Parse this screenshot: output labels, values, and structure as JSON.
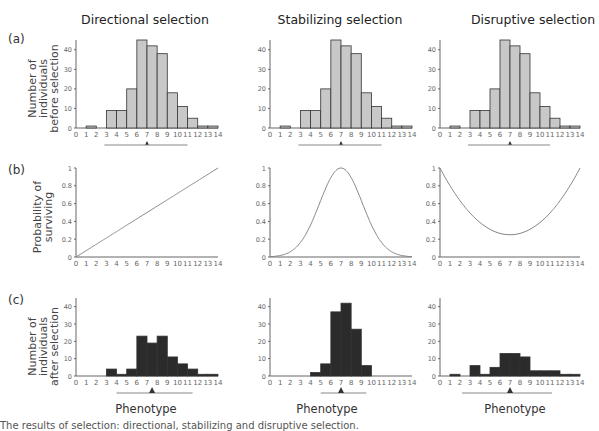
{
  "columns": [
    {
      "title": "Directional selection",
      "xlabel": "Phenotype"
    },
    {
      "title": "Stabilizing selection",
      "xlabel": "Phenotype"
    },
    {
      "title": "Disruptive selection",
      "xlabel": "Phenotype"
    }
  ],
  "rows": [
    {
      "label": "(a)",
      "ylabel_lines": [
        "Number of",
        "individuals",
        "before selection"
      ]
    },
    {
      "label": "(b)",
      "ylabel_lines": [
        "Probability of",
        "surviving"
      ]
    },
    {
      "label": "(c)",
      "ylabel_lines": [
        "Number of",
        "individuals",
        "after selection"
      ]
    }
  ],
  "colors": {
    "before_bar": "#c8c8c8",
    "after_bar": "#2b2b2b",
    "axis": "#666666",
    "curve": "#888888"
  },
  "chart_data": [
    {
      "panel": "a-directional",
      "type": "bar",
      "title": "Directional selection",
      "ylabel": "Number of individuals before selection",
      "x": [
        0,
        1,
        2,
        3,
        4,
        5,
        6,
        7,
        8,
        9,
        10,
        11,
        12,
        13,
        14
      ],
      "values": [
        0,
        1,
        0,
        9,
        9,
        20,
        45,
        42,
        38,
        18,
        11,
        5,
        1,
        1
      ],
      "yticks": [
        0,
        10,
        20,
        30,
        40
      ],
      "mean_marker": 7
    },
    {
      "panel": "a-stabilizing",
      "type": "bar",
      "title": "Stabilizing selection",
      "x": [
        0,
        1,
        2,
        3,
        4,
        5,
        6,
        7,
        8,
        9,
        10,
        11,
        12,
        13,
        14
      ],
      "values": [
        0,
        1,
        0,
        9,
        9,
        20,
        45,
        42,
        38,
        18,
        11,
        5,
        1,
        1
      ],
      "yticks": [
        0,
        10,
        20,
        30,
        40
      ],
      "mean_marker": 7
    },
    {
      "panel": "a-disruptive",
      "type": "bar",
      "title": "Disruptive selection",
      "x": [
        0,
        1,
        2,
        3,
        4,
        5,
        6,
        7,
        8,
        9,
        10,
        11,
        12,
        13,
        14
      ],
      "values": [
        0,
        1,
        0,
        9,
        9,
        20,
        45,
        42,
        38,
        18,
        11,
        5,
        1,
        1
      ],
      "yticks": [
        0,
        10,
        20,
        30,
        40
      ],
      "mean_marker": 7
    },
    {
      "panel": "b-directional",
      "type": "line",
      "ylabel": "Probability of surviving",
      "x": [
        0,
        14
      ],
      "y": [
        0,
        1
      ],
      "yticks": [
        0,
        0.2,
        0.4,
        0.6,
        0.8,
        1
      ],
      "ylim": [
        0,
        1
      ]
    },
    {
      "panel": "b-stabilizing",
      "type": "line",
      "description": "bell curve peaking at 1 at x=7, ~0 at x=0 and x=14",
      "peak": {
        "x": 7,
        "y": 1
      },
      "yticks": [
        0,
        0.2,
        0.4,
        0.6,
        0.8,
        1
      ],
      "ylim": [
        0,
        1
      ]
    },
    {
      "panel": "b-disruptive",
      "type": "line",
      "description": "U-shaped curve, 1 at x=0 and x=14, minimum ~0.25 at x=7",
      "min": {
        "x": 7,
        "y": 0.25
      },
      "yticks": [
        0,
        0.2,
        0.4,
        0.6,
        0.8,
        1
      ],
      "ylim": [
        0,
        1
      ]
    },
    {
      "panel": "c-directional",
      "type": "bar",
      "ylabel": "Number of individuals after selection",
      "x": [
        0,
        1,
        2,
        3,
        4,
        5,
        6,
        7,
        8,
        9,
        10,
        11,
        12,
        13,
        14
      ],
      "values": [
        0,
        0,
        0,
        4,
        1,
        4,
        23,
        19,
        23,
        11,
        7,
        4,
        1,
        1
      ],
      "yticks": [
        0,
        10,
        20,
        30,
        40
      ],
      "mean_marker": 7.5
    },
    {
      "panel": "c-stabilizing",
      "type": "bar",
      "x": [
        0,
        1,
        2,
        3,
        4,
        5,
        6,
        7,
        8,
        9,
        10,
        11,
        12,
        13,
        14
      ],
      "values": [
        0,
        0,
        0,
        0,
        2,
        7,
        37,
        42,
        27,
        6,
        0,
        0,
        0,
        0
      ],
      "yticks": [
        0,
        10,
        20,
        30,
        40
      ],
      "mean_marker": 7
    },
    {
      "panel": "c-disruptive",
      "type": "bar",
      "x": [
        0,
        1,
        2,
        3,
        4,
        5,
        6,
        7,
        8,
        9,
        10,
        11,
        12,
        13,
        14
      ],
      "values": [
        0,
        1,
        0,
        6,
        1,
        5,
        13,
        13,
        11,
        3,
        3,
        3,
        1,
        1
      ],
      "yticks": [
        0,
        10,
        20,
        30,
        40
      ],
      "mean_marker": 7
    }
  ],
  "xtick_labels": [
    "0",
    "1",
    "2",
    "3",
    "4",
    "5",
    "6",
    "7",
    "8",
    "9",
    "10",
    "11",
    "12",
    "13",
    "14"
  ],
  "count_ytick_labels": [
    "0",
    "10",
    "20",
    "30",
    "40"
  ],
  "prob_ytick_labels": [
    "0",
    "0.2",
    "0.4",
    "0.6",
    "0.8",
    "1"
  ],
  "caption": "The results of selection: directional, stabilizing and disruptive selection."
}
